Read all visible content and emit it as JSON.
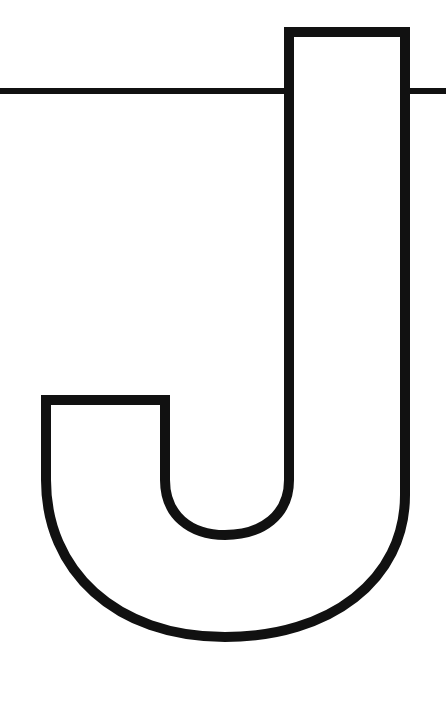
{
  "image": {
    "subject": "Outlined capital letter J",
    "letter": "J",
    "stroke_color": "#111111",
    "background_color": "#ffffff",
    "stroke_width": 10,
    "rule_line_width": 6
  }
}
